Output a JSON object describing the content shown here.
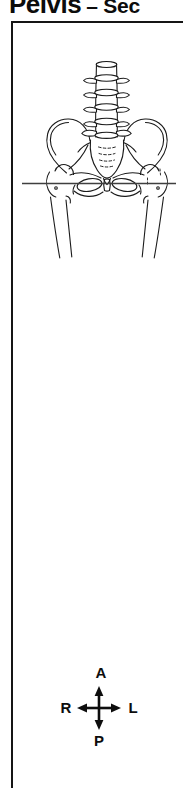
{
  "header": {
    "title": "Pelvis",
    "title_suffix": "– Sec"
  },
  "figure": {
    "icon": "pelvis-anterior-view-line-drawing",
    "section_line": "axial-section-level-indicator"
  },
  "compass": {
    "top": "A",
    "bottom": "P",
    "left": "R",
    "right": "L"
  },
  "colors": {
    "ink": "#1b1b1b",
    "frame_border": "#151515",
    "section_line": "#3f3f3f",
    "background": "#ffffff"
  }
}
